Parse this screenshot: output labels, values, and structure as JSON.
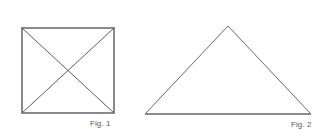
{
  "page": {
    "background_color": "#ffffff",
    "width": 320,
    "height": 137
  },
  "figures": [
    {
      "id": "fig-1",
      "shape": "square-with-diagonals",
      "caption": "Fig. 1",
      "outline_color": "#8a8a8a",
      "diagonal_color": "#5e5e5e",
      "outline_width": 1.6,
      "diagonal_width": 1,
      "vertices": {
        "top_left": [
          22,
          28
        ],
        "top_right": [
          114,
          28
        ],
        "bottom_right": [
          114,
          113
        ],
        "bottom_left": [
          22,
          113
        ]
      },
      "diagonals": [
        {
          "from": [
            22,
            28
          ],
          "to": [
            114,
            113
          ]
        },
        {
          "from": [
            114,
            28
          ],
          "to": [
            22,
            113
          ]
        }
      ],
      "center": [
        68,
        70.5
      ]
    },
    {
      "id": "fig-2",
      "shape": "triangle",
      "caption": "Fig. 2",
      "outline_color": "#6a6a6a",
      "base_color": "#8a8a8a",
      "outline_width": 1,
      "base_width": 1.6,
      "vertices": {
        "apex": [
          228,
          26
        ],
        "bottom_left": [
          145,
          114
        ],
        "bottom_right": [
          311,
          114
        ]
      }
    }
  ],
  "captions": {
    "fig_1": "Fig. 1",
    "fig_2": "Fig. 2",
    "color": "#5a5a5a"
  }
}
